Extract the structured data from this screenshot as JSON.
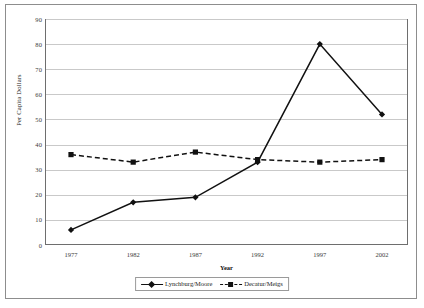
{
  "chart_data": {
    "type": "line",
    "title": "",
    "xlabel": "Year",
    "ylabel": "Per Capita Dollars",
    "categories": [
      "1977",
      "1982",
      "1987",
      "1992",
      "1997",
      "2002"
    ],
    "x": [
      1977,
      1982,
      1987,
      1992,
      1997,
      2002
    ],
    "xlim": [
      1977,
      2002
    ],
    "ylim": [
      0,
      90
    ],
    "yticks": [
      0,
      10,
      20,
      30,
      40,
      50,
      60,
      70,
      80,
      90
    ],
    "ytick_labels": [
      "0",
      "10",
      "20",
      "30",
      "40",
      "50",
      "60",
      "70",
      "80",
      "90"
    ],
    "grid": "horizontal",
    "legend_position": "bottom-center",
    "series": [
      {
        "name": "Lynchburg/Moore",
        "values": [
          6,
          17,
          19,
          33,
          80,
          52
        ],
        "line_style": "solid",
        "marker": "diamond",
        "color": "#111111"
      },
      {
        "name": "Decatur/Meigs",
        "values": [
          36,
          33,
          37,
          34,
          33,
          34
        ],
        "line_style": "dashed",
        "marker": "square",
        "color": "#111111"
      }
    ]
  },
  "colors": {
    "grid": "#c9c9c9",
    "axis": "#6e6e6e",
    "frame": "#8d8d8d",
    "text": "#1a1a1a",
    "background": "#ffffff"
  }
}
